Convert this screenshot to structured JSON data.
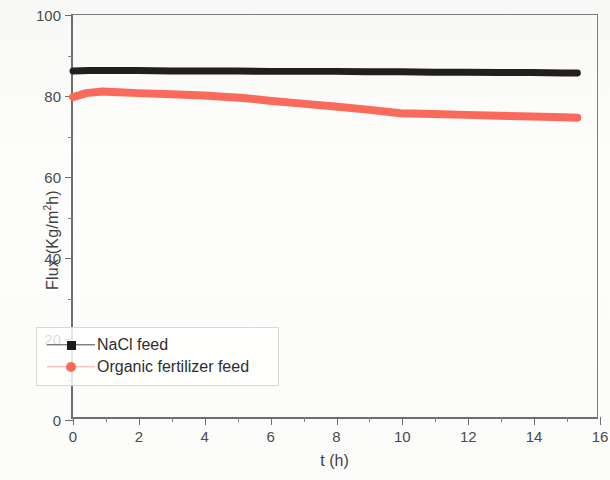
{
  "chart_data": {
    "type": "line",
    "title": "",
    "xlabel": "t (h)",
    "ylabel": "Flux (Kg/m²h)",
    "ylabel_prefix": "Flux (Kg/m",
    "ylabel_sup": "2",
    "ylabel_suffix": "h)",
    "xlim": [
      0,
      16
    ],
    "ylim": [
      0,
      100
    ],
    "xticks": [
      0,
      2,
      4,
      6,
      8,
      10,
      12,
      14,
      16
    ],
    "xticks_minor": [
      1,
      3,
      5,
      7,
      9,
      11,
      13,
      15
    ],
    "yticks": [
      0,
      20,
      40,
      60,
      80,
      100
    ],
    "yticks_minor": [
      10,
      30,
      50,
      70,
      90
    ],
    "xtick_labels": [
      "0",
      "2",
      "4",
      "6",
      "8",
      "10",
      "12",
      "14",
      "16"
    ],
    "ytick_labels": [
      "0",
      "20",
      "40",
      "60",
      "80",
      "100"
    ],
    "grid": false,
    "legend_position": "lower-left-inside",
    "series": [
      {
        "name": "NaCl feed",
        "color": "#231f1e",
        "marker": "square",
        "line_width_px": 7,
        "x": [
          0.0,
          0.5,
          1.0,
          2.0,
          3.0,
          4.0,
          5.0,
          6.0,
          7.0,
          8.0,
          9.0,
          10.0,
          11.0,
          12.0,
          13.0,
          14.0,
          15.0,
          15.4
        ],
        "y": [
          86.1,
          86.2,
          86.2,
          86.2,
          86.1,
          86.1,
          86.1,
          86.0,
          86.0,
          86.0,
          85.9,
          85.9,
          85.8,
          85.8,
          85.7,
          85.7,
          85.6,
          85.6
        ]
      },
      {
        "name": "Organic fertilizer feed",
        "color": "#fa6a5a",
        "marker": "circle",
        "line_width_px": 8,
        "x": [
          0.0,
          0.4,
          0.9,
          1.4,
          2.0,
          3.0,
          4.0,
          5.2,
          6.0,
          7.0,
          8.0,
          9.0,
          10.0,
          11.0,
          12.0,
          13.0,
          14.0,
          15.0,
          15.4
        ],
        "y": [
          79.6,
          80.6,
          81.0,
          80.8,
          80.6,
          80.3,
          80.0,
          79.4,
          78.7,
          78.0,
          77.3,
          76.5,
          75.6,
          75.4,
          75.2,
          75.0,
          74.8,
          74.6,
          74.5
        ]
      }
    ]
  },
  "legend": {
    "items": [
      {
        "label": "NaCl feed",
        "color": "#1d1b1a",
        "marker": "square"
      },
      {
        "label": "Organic fertilizer feed",
        "color": "#fa6a5a",
        "marker": "circle"
      }
    ]
  }
}
